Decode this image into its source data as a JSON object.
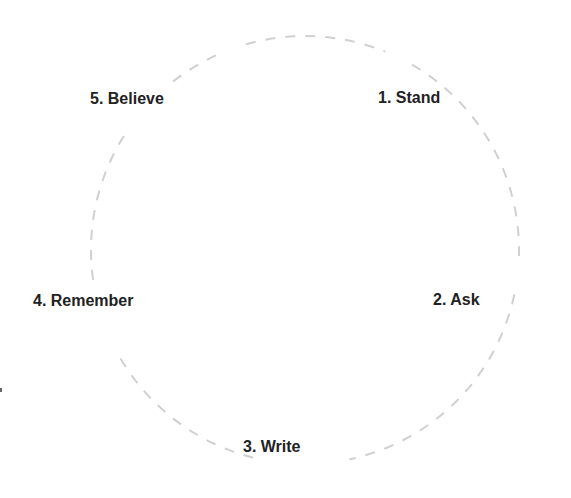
{
  "diagram": {
    "type": "cycle",
    "ring": {
      "cx": 305,
      "cy": 250,
      "r": 214,
      "stroke": "#d0d0d0",
      "dash": "10 10"
    },
    "steps": [
      {
        "label": "1. Stand",
        "x": 378,
        "y": 89
      },
      {
        "label": "2. Ask",
        "x": 433,
        "y": 291
      },
      {
        "label": "3. Write",
        "x": 243,
        "y": 438
      },
      {
        "label": "4. Remember",
        "x": 33,
        "y": 292
      },
      {
        "label": "5. Believe",
        "x": 90,
        "y": 90
      }
    ]
  }
}
